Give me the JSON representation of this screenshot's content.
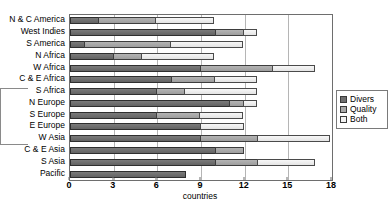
{
  "chart_data": {
    "type": "bar",
    "orientation": "horizontal",
    "stacked": true,
    "title": "",
    "xlabel": "countries",
    "ylabel": "",
    "xlim": [
      0,
      18
    ],
    "xticks": [
      0,
      3,
      6,
      9,
      12,
      15,
      18
    ],
    "grid": true,
    "legend_position": "right",
    "categories": [
      "N & C America",
      "West Indies",
      "S America",
      "N Africa",
      "W Africa",
      "C & E Africa",
      "S Africa",
      "N Europe",
      "S Europe",
      "E Europe",
      "W Asia",
      "C & E Asia",
      "S Asia",
      "Pacific"
    ],
    "series": [
      {
        "name": "Diversity",
        "color": "#6f6f6f",
        "values": [
          2,
          10,
          1,
          3,
          9,
          7,
          6,
          11,
          6,
          9,
          9,
          10,
          10,
          8
        ]
      },
      {
        "name": "Quality",
        "color": "#a9a9a9",
        "values": [
          4,
          2,
          6,
          2,
          5,
          3,
          2,
          1,
          3,
          0,
          4,
          2,
          3,
          0
        ]
      },
      {
        "name": "Both",
        "color": "#eeeeee",
        "values": [
          4,
          1,
          5,
          5,
          3,
          3,
          5,
          1,
          3,
          3,
          5,
          0,
          4,
          0
        ]
      }
    ],
    "totals": [
      10,
      13,
      12,
      10,
      17,
      13,
      13,
      13,
      12,
      12,
      18,
      12,
      17,
      8
    ]
  },
  "legend": {
    "items": [
      {
        "label": "Divers",
        "key": "diversity"
      },
      {
        "label": "Quality",
        "key": "quality"
      },
      {
        "label": "Both",
        "key": "both"
      }
    ]
  },
  "axis": {
    "x_title": "countries",
    "x_tick_labels": [
      "0",
      "3",
      "6",
      "9",
      "12",
      "15",
      "18"
    ]
  }
}
